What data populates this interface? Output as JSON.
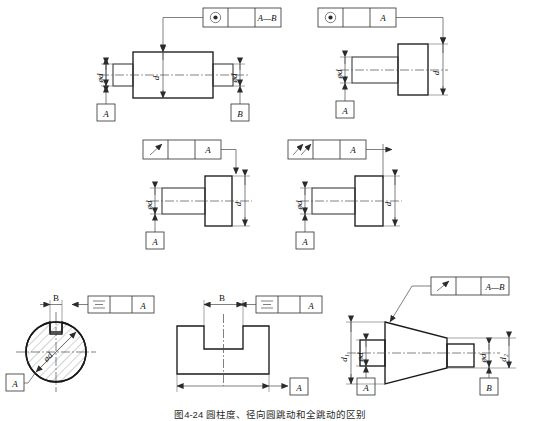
{
  "figure": {
    "caption": "图4-24  圆柱度、径向圆跳动和全跳动的区别",
    "background": "#ffffff",
    "line_color": "#2b2b2b"
  },
  "panels": [
    {
      "id": "top-left",
      "symbol_name": "coaxiality-icon",
      "symbol_glyph": "concentricity",
      "frame_cells": [
        "",
        "",
        "A—B"
      ],
      "datums": [
        "A",
        "B"
      ],
      "dim_labels": [
        "ød",
        "ød",
        "d"
      ],
      "part": "stepped-shaft-symmetric"
    },
    {
      "id": "top-right",
      "symbol_name": "coaxiality-icon",
      "symbol_glyph": "concentricity",
      "frame_cells": [
        "",
        "",
        "A"
      ],
      "datums": [
        "A"
      ],
      "dim_labels": [
        "ød",
        "d"
      ],
      "part": "stepped-shaft-flange"
    },
    {
      "id": "mid-left",
      "symbol_name": "circular-runout-icon",
      "symbol_glyph": "runout-single",
      "frame_cells": [
        "",
        "",
        "A"
      ],
      "datums": [
        "A"
      ],
      "dim_labels": [
        "ød",
        "d"
      ],
      "part": "stepped-shaft-flange"
    },
    {
      "id": "mid-right",
      "symbol_name": "total-runout-icon",
      "symbol_glyph": "runout-total",
      "frame_cells": [
        "",
        "",
        "A"
      ],
      "datums": [
        "A"
      ],
      "dim_labels": [
        "ød",
        "d"
      ],
      "part": "stepped-shaft-flange"
    },
    {
      "id": "bottom-left",
      "symbol_name": "symmetry-icon",
      "symbol_glyph": "symmetry",
      "frame_cells": [
        "",
        "",
        "A"
      ],
      "datums": [
        "A"
      ],
      "dim_labels": [
        "B",
        "ød"
      ],
      "part": "keyed-round-section"
    },
    {
      "id": "bottom-middle",
      "symbol_name": "symmetry-icon",
      "symbol_glyph": "symmetry",
      "frame_cells": [
        "",
        "",
        "A"
      ],
      "datums": [
        "A"
      ],
      "dim_labels": [
        "B"
      ],
      "part": "slotted-block"
    },
    {
      "id": "bottom-right",
      "symbol_name": "circular-runout-icon",
      "symbol_glyph": "runout-single",
      "frame_cells": [
        "",
        "",
        "A—B"
      ],
      "datums": [
        "A",
        "B"
      ],
      "dim_labels": [
        "d₁",
        "ød",
        "ød",
        "d₂"
      ],
      "part": "tapered-cone-shaft"
    }
  ]
}
